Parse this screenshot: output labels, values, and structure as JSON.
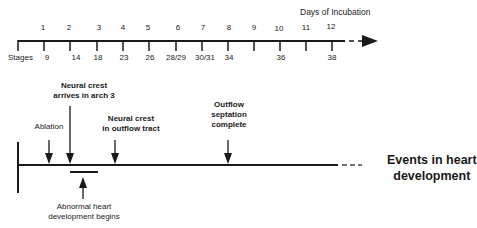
{
  "timeline": {
    "days_title": "Days of Incubation",
    "stages_label": "Stages",
    "days": [
      {
        "label": "1",
        "x": 43
      },
      {
        "label": "2",
        "x": 69
      },
      {
        "label": "3",
        "x": 99
      },
      {
        "label": "4",
        "x": 123
      },
      {
        "label": "5",
        "x": 148
      },
      {
        "label": "6",
        "x": 178
      },
      {
        "label": "7",
        "x": 203
      },
      {
        "label": "8",
        "x": 229
      },
      {
        "label": "9",
        "x": 254
      },
      {
        "label": "10",
        "x": 279
      },
      {
        "label": "11",
        "x": 306
      },
      {
        "label": "12",
        "x": 331
      }
    ],
    "stages": [
      {
        "label": "9",
        "x": 47
      },
      {
        "label": "14",
        "x": 76
      },
      {
        "label": "18",
        "x": 98
      },
      {
        "label": "23",
        "x": 124
      },
      {
        "label": "26",
        "x": 150
      },
      {
        "label": "28/29",
        "x": 176
      },
      {
        "label": "30/31",
        "x": 205
      },
      {
        "label": "34",
        "x": 229
      },
      {
        "label": "36",
        "x": 281
      },
      {
        "label": "38",
        "x": 332
      }
    ]
  },
  "events": {
    "title_line1": "Events in heart",
    "title_line2": "development",
    "ablation": "Ablation",
    "neural_crest_arch_line1": "Neural crest",
    "neural_crest_arch_line2": "arrives in arch 3",
    "neural_crest_outflow_line1": "Neural crest",
    "neural_crest_outflow_line2": "in outflow  tract",
    "septation_line1": "Outflow",
    "septation_line2": "septation",
    "septation_line3": "complete",
    "abnormal_line1": "Abnormal heart",
    "abnormal_line2": "development begins"
  },
  "colors": {
    "ink": "#1a1a1a",
    "background": "#ffffff"
  }
}
